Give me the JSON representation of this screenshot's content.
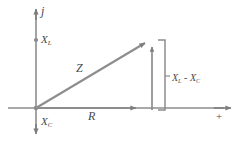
{
  "figure": {
    "type": "impedance-phasor-diagram",
    "title": "",
    "stroke_color": "#8a8a8a",
    "text_color": "#4a4a4a",
    "background": "#ffffff",
    "width": 243,
    "height": 143
  },
  "axes": {
    "vertical": {
      "name": "imaginary-axis",
      "label": "j",
      "positive_label": "X",
      "positive_sub": "L",
      "negative_label": "X",
      "negative_sub": "C",
      "x": 36,
      "top": 10,
      "bottom": 133
    },
    "horizontal": {
      "name": "real-axis",
      "label": "+",
      "y": 108,
      "left": 8,
      "right": 232
    }
  },
  "vectors": {
    "hypotenuse": {
      "label": "Z",
      "from": [
        36,
        108
      ],
      "to": [
        147,
        42
      ]
    },
    "resistive": {
      "label": "R",
      "from": [
        36,
        108
      ],
      "to": [
        143,
        108
      ]
    },
    "reactive": {
      "label_lead": "X",
      "label_lead_sub": "L",
      "separator": " - ",
      "label_lag": "X",
      "label_lag_sub": "C",
      "from": [
        152,
        108
      ],
      "to": [
        152,
        44
      ]
    }
  },
  "annotations": {
    "bracket": {
      "name": "reactance-bracket",
      "x": 164,
      "top": 40,
      "bottom": 110
    },
    "reactance_label": {
      "lead": "X",
      "lead_sub": "L",
      "dash": " - ",
      "lag": "X",
      "lag_sub": "C"
    }
  }
}
